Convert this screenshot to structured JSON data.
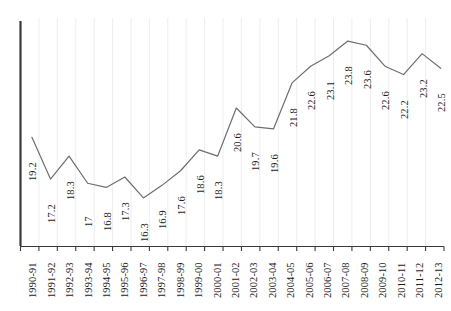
{
  "chart_data": {
    "type": "line",
    "title": "",
    "subtitle": "",
    "xlabel": "",
    "ylabel": "",
    "grid": "vertical-only",
    "legend": "none",
    "ylim": [
      14.0,
      25.0
    ],
    "categories": [
      "1990-91",
      "1991-92",
      "1992-93",
      "1993-94",
      "1994-95",
      "1995-96",
      "1996-97",
      "1997-98",
      "1998-99",
      "1999-00",
      "2000-01",
      "2001-02",
      "2002-03",
      "2003-04",
      "2004-05",
      "2005-06",
      "2006-07",
      "2007-08",
      "2008-09",
      "2009-10",
      "2010-11",
      "2011-12",
      "2012-13"
    ],
    "values": [
      19.2,
      17.2,
      18.3,
      17,
      16.8,
      17.3,
      16.3,
      16.9,
      17.6,
      18.6,
      18.3,
      20.6,
      19.7,
      19.6,
      21.8,
      22.6,
      23.1,
      23.8,
      23.6,
      22.6,
      22.2,
      23.2,
      22.5
    ],
    "value_labels": [
      "19.2",
      "17.2",
      "18.3",
      "17",
      "16.8",
      "17.3",
      "16.3",
      "16.9",
      "17.6",
      "18.6",
      "18.3",
      "20.6",
      "19.7",
      "19.6",
      "21.8",
      "22.6",
      "23.1",
      "23.8",
      "23.6",
      "22.6",
      "22.2",
      "23.2",
      "22.5"
    ],
    "series": [
      {
        "name": "series-1",
        "color": "#6e6e6e",
        "values": [
          19.2,
          17.2,
          18.3,
          17,
          16.8,
          17.3,
          16.3,
          16.9,
          17.6,
          18.6,
          18.3,
          20.6,
          19.7,
          19.6,
          21.8,
          22.6,
          23.1,
          23.8,
          23.6,
          22.6,
          22.2,
          23.2,
          22.5
        ]
      }
    ]
  },
  "style": {
    "line_color": "#6e6e6e",
    "axis_color": "#3a3a3a",
    "gridline_color": "#ececec",
    "label_color": "#1c1c1c",
    "background": "#ffffff"
  }
}
